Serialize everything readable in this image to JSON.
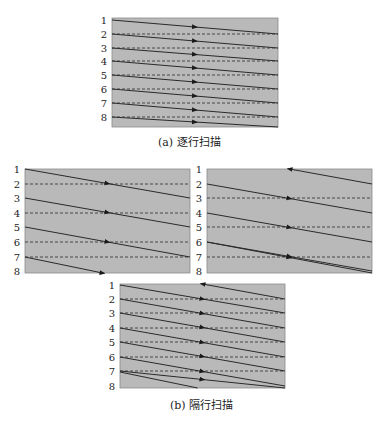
{
  "colors": {
    "fill": "#b9b9b9",
    "border": "#8a8a8a",
    "line": "#2a2a2a",
    "dashed": "#3a3a3a",
    "text": "#222222"
  },
  "row_labels": [
    "1",
    "2",
    "3",
    "4",
    "5",
    "6",
    "7",
    "8"
  ],
  "panels": {
    "progressive": {
      "box": {
        "x": 112,
        "y": 18,
        "w": 166,
        "h": 109
      },
      "label_x": 104,
      "rows": [
        20,
        34,
        48,
        61,
        75,
        89,
        103,
        117
      ],
      "mode": "progressive"
    },
    "interlaced_odd": {
      "box": {
        "x": 25,
        "y": 169,
        "w": 165,
        "h": 104
      },
      "label_x": 17,
      "rows": [
        169,
        184,
        198,
        213,
        227,
        242,
        257,
        271
      ],
      "mode": "odd"
    },
    "interlaced_even": {
      "box": {
        "x": 207,
        "y": 169,
        "w": 165,
        "h": 104
      },
      "label_x": 199,
      "rows": [
        169,
        184,
        198,
        213,
        227,
        242,
        257,
        271
      ],
      "mode": "even"
    },
    "interlaced_combined": {
      "box": {
        "x": 120,
        "y": 284,
        "w": 165,
        "h": 104
      },
      "label_x": 112,
      "rows": [
        285,
        299,
        313,
        328,
        342,
        357,
        371,
        386
      ],
      "mode": "combined"
    }
  },
  "captions": {
    "a": "(a) 逐行扫描",
    "b": "(b) 隔行扫描"
  }
}
